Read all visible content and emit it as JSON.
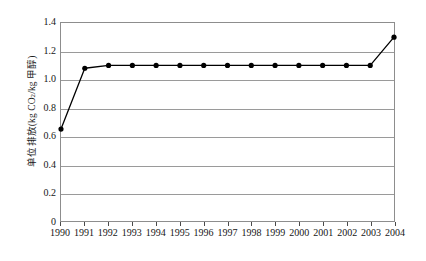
{
  "chart_data": {
    "type": "line",
    "title": "",
    "subtitle": "",
    "xlabel": "",
    "ylabel": "单位排放(kg CO₂/kg 甲醇)",
    "ylabel_parts": {
      "prefix": "单位排放(kg CO",
      "sub": "2",
      "suffix": "/kg 甲醇)"
    },
    "categories": [
      "1990",
      "1991",
      "1992",
      "1993",
      "1994",
      "1995",
      "1996",
      "1997",
      "1998",
      "1999",
      "2000",
      "2001",
      "2002",
      "2003",
      "2004"
    ],
    "values": [
      0.65,
      1.08,
      1.1,
      1.1,
      1.1,
      1.1,
      1.1,
      1.1,
      1.1,
      1.1,
      1.1,
      1.1,
      1.1,
      1.1,
      1.3
    ],
    "x": [
      1990,
      1991,
      1992,
      1993,
      1994,
      1995,
      1996,
      1997,
      1998,
      1999,
      2000,
      2001,
      2002,
      2003,
      2004
    ],
    "ylim": [
      0,
      1.4
    ],
    "yticks": [
      0,
      0.2,
      0.4,
      0.6,
      0.8,
      1.0,
      1.2,
      1.4
    ],
    "ytick_labels": [
      "0",
      "0.2",
      "0.4",
      "0.6",
      "0.8",
      "1.0",
      "1.2",
      "1.4"
    ],
    "xlim": [
      1990,
      2004
    ],
    "grid": "horizontal",
    "legend": "none",
    "series": [
      {
        "name": "单位排放",
        "values": [
          0.65,
          1.08,
          1.1,
          1.1,
          1.1,
          1.1,
          1.1,
          1.1,
          1.1,
          1.1,
          1.1,
          1.1,
          1.1,
          1.1,
          1.3
        ],
        "color": "#000000",
        "marker": "filled-circle"
      }
    ],
    "colors": {
      "line": "#000000",
      "marker": "#000000",
      "grid": "#9a9a9a",
      "axis": "#8d8d8d",
      "background": "#ffffff",
      "text": "#161616"
    }
  }
}
